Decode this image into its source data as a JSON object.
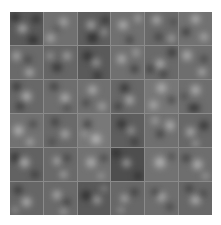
{
  "figure": {
    "rows": 6,
    "cols": 6,
    "separator_color": "#8a8a8a",
    "cells": [
      {
        "base": "#5a5a5a",
        "blobs": [
          [
            "l",
            38,
            50,
            40,
            36
          ],
          [
            "d",
            70,
            85,
            45,
            30
          ],
          [
            "d",
            15,
            15,
            35,
            30
          ],
          [
            "d",
            80,
            20,
            30,
            30
          ]
        ]
      },
      {
        "base": "#707070",
        "blobs": [
          [
            "l",
            60,
            30,
            35,
            30
          ],
          [
            "d",
            40,
            50,
            18,
            18
          ],
          [
            "l",
            20,
            80,
            35,
            30
          ]
        ]
      },
      {
        "base": "#5e5e5e",
        "blobs": [
          [
            "d",
            45,
            78,
            45,
            35
          ],
          [
            "l",
            40,
            40,
            35,
            30
          ],
          [
            "d",
            85,
            25,
            25,
            30
          ],
          [
            "l",
            80,
            60,
            25,
            25
          ]
        ]
      },
      {
        "base": "#707070",
        "blobs": [
          [
            "l",
            35,
            40,
            45,
            30
          ],
          [
            "d",
            55,
            85,
            30,
            25
          ],
          [
            "l",
            80,
            20,
            25,
            25
          ]
        ]
      },
      {
        "base": "#6a6a6a",
        "blobs": [
          [
            "l",
            35,
            25,
            40,
            30
          ],
          [
            "d",
            40,
            75,
            30,
            25
          ],
          [
            "l",
            80,
            80,
            25,
            25
          ],
          [
            "d",
            85,
            30,
            20,
            20
          ]
        ]
      },
      {
        "base": "#727272",
        "blobs": [
          [
            "l",
            50,
            20,
            40,
            30
          ],
          [
            "d",
            20,
            60,
            30,
            30
          ],
          [
            "l",
            75,
            75,
            30,
            30
          ]
        ]
      },
      {
        "base": "#6a6a6a",
        "blobs": [
          [
            "l",
            20,
            30,
            30,
            35
          ],
          [
            "d",
            55,
            40,
            22,
            22
          ],
          [
            "l",
            60,
            80,
            40,
            28
          ]
        ]
      },
      {
        "base": "#666666",
        "blobs": [
          [
            "d",
            40,
            65,
            40,
            30
          ],
          [
            "l",
            70,
            30,
            30,
            30
          ],
          [
            "l",
            20,
            30,
            25,
            25
          ]
        ]
      },
      {
        "base": "#5a5a5a",
        "blobs": [
          [
            "d",
            30,
            30,
            35,
            35
          ],
          [
            "l",
            55,
            50,
            30,
            30
          ],
          [
            "d",
            60,
            90,
            35,
            25
          ]
        ]
      },
      {
        "base": "#707070",
        "blobs": [
          [
            "l",
            30,
            40,
            35,
            35
          ],
          [
            "d",
            70,
            70,
            30,
            30
          ],
          [
            "l",
            75,
            20,
            25,
            25
          ]
        ]
      },
      {
        "base": "#6a6a6a",
        "blobs": [
          [
            "l",
            45,
            55,
            35,
            35
          ],
          [
            "d",
            80,
            20,
            30,
            35
          ],
          [
            "d",
            55,
            85,
            28,
            25
          ],
          [
            "d",
            15,
            70,
            25,
            30
          ]
        ]
      },
      {
        "base": "#6e6e6e",
        "blobs": [
          [
            "l",
            25,
            30,
            30,
            45
          ],
          [
            "l",
            70,
            80,
            30,
            30
          ],
          [
            "d",
            75,
            40,
            25,
            25
          ]
        ]
      },
      {
        "base": "#686868",
        "blobs": [
          [
            "d",
            20,
            20,
            30,
            35
          ],
          [
            "l",
            50,
            50,
            40,
            40
          ],
          [
            "d",
            30,
            80,
            30,
            25
          ]
        ]
      },
      {
        "base": "#6e6e6e",
        "blobs": [
          [
            "d",
            30,
            20,
            30,
            25
          ],
          [
            "l",
            65,
            55,
            35,
            35
          ],
          [
            "d",
            70,
            85,
            25,
            20
          ]
        ]
      },
      {
        "base": "#707070",
        "blobs": [
          [
            "l",
            45,
            30,
            40,
            30
          ],
          [
            "d",
            25,
            70,
            25,
            25
          ],
          [
            "l",
            75,
            80,
            30,
            25
          ]
        ]
      },
      {
        "base": "#686868",
        "blobs": [
          [
            "d",
            40,
            25,
            40,
            30
          ],
          [
            "l",
            55,
            60,
            35,
            35
          ],
          [
            "d",
            20,
            80,
            25,
            25
          ]
        ]
      },
      {
        "base": "#777777",
        "blobs": [
          [
            "l",
            50,
            25,
            40,
            35
          ],
          [
            "l",
            25,
            75,
            35,
            30
          ],
          [
            "d",
            80,
            60,
            25,
            25
          ]
        ]
      },
      {
        "base": "#6e6e6e",
        "blobs": [
          [
            "l",
            50,
            30,
            40,
            35
          ],
          [
            "d",
            45,
            85,
            60,
            25
          ],
          [
            "d",
            15,
            50,
            20,
            20
          ]
        ]
      },
      {
        "base": "#727272",
        "blobs": [
          [
            "l",
            25,
            50,
            40,
            40
          ],
          [
            "d",
            70,
            30,
            25,
            25
          ],
          [
            "l",
            60,
            85,
            30,
            25
          ]
        ]
      },
      {
        "base": "#6a6a6a",
        "blobs": [
          [
            "d",
            35,
            25,
            30,
            25
          ],
          [
            "l",
            65,
            60,
            35,
            30
          ],
          [
            "d",
            25,
            85,
            25,
            20
          ]
        ]
      },
      {
        "base": "#787878",
        "blobs": [
          [
            "l",
            55,
            75,
            50,
            35
          ],
          [
            "d",
            30,
            30,
            30,
            30
          ],
          [
            "l",
            20,
            60,
            20,
            20
          ]
        ]
      },
      {
        "base": "#5e5e5e",
        "blobs": [
          [
            "d",
            30,
            30,
            35,
            35
          ],
          [
            "l",
            60,
            50,
            25,
            30
          ],
          [
            "d",
            70,
            85,
            30,
            25
          ]
        ]
      },
      {
        "base": "#707070",
        "blobs": [
          [
            "l",
            75,
            35,
            30,
            45
          ],
          [
            "d",
            45,
            60,
            25,
            30
          ],
          [
            "l",
            30,
            20,
            25,
            25
          ]
        ]
      },
      {
        "base": "#686868",
        "blobs": [
          [
            "d",
            75,
            35,
            30,
            40
          ],
          [
            "l",
            35,
            55,
            35,
            35
          ],
          [
            "l",
            50,
            90,
            30,
            20
          ]
        ]
      },
      {
        "base": "#626262",
        "blobs": [
          [
            "d",
            15,
            30,
            25,
            45
          ],
          [
            "l",
            45,
            45,
            40,
            40
          ],
          [
            "d",
            75,
            80,
            25,
            25
          ]
        ]
      },
      {
        "base": "#6a6a6a",
        "blobs": [
          [
            "l",
            40,
            40,
            30,
            30
          ],
          [
            "d",
            70,
            30,
            25,
            25
          ],
          [
            "l",
            60,
            80,
            30,
            25
          ]
        ]
      },
      {
        "base": "#727272",
        "blobs": [
          [
            "l",
            40,
            45,
            35,
            40
          ],
          [
            "d",
            80,
            30,
            25,
            25
          ],
          [
            "l",
            70,
            85,
            25,
            20
          ]
        ]
      },
      {
        "base": "#4e4e4e",
        "blobs": [
          [
            "l",
            45,
            45,
            35,
            30
          ],
          [
            "d",
            15,
            15,
            30,
            30
          ],
          [
            "d",
            80,
            85,
            30,
            25
          ]
        ]
      },
      {
        "base": "#727272",
        "blobs": [
          [
            "l",
            45,
            45,
            45,
            45
          ],
          [
            "d",
            80,
            25,
            20,
            20
          ]
        ]
      },
      {
        "base": "#6e6e6e",
        "blobs": [
          [
            "l",
            55,
            50,
            40,
            40
          ],
          [
            "d",
            20,
            30,
            25,
            30
          ],
          [
            "l",
            80,
            85,
            25,
            20
          ]
        ]
      },
      {
        "base": "#666666",
        "blobs": [
          [
            "d",
            25,
            25,
            30,
            30
          ],
          [
            "l",
            50,
            60,
            40,
            35
          ],
          [
            "l",
            15,
            85,
            25,
            20
          ]
        ]
      },
      {
        "base": "#6a6a6a",
        "blobs": [
          [
            "l",
            40,
            40,
            35,
            30
          ],
          [
            "d",
            70,
            60,
            25,
            25
          ],
          [
            "l",
            60,
            90,
            30,
            20
          ]
        ]
      },
      {
        "base": "#5a5a5a",
        "blobs": [
          [
            "d",
            25,
            40,
            35,
            40
          ],
          [
            "l",
            60,
            55,
            30,
            30
          ],
          [
            "l",
            80,
            20,
            20,
            20
          ]
        ]
      },
      {
        "base": "#686868",
        "blobs": [
          [
            "l",
            40,
            50,
            35,
            30
          ],
          [
            "d",
            70,
            30,
            25,
            25
          ],
          [
            "l",
            30,
            85,
            25,
            20
          ]
        ]
      },
      {
        "base": "#6e6e6e",
        "blobs": [
          [
            "l",
            50,
            45,
            35,
            35
          ],
          [
            "d",
            30,
            30,
            25,
            25
          ],
          [
            "d",
            75,
            75,
            25,
            25
          ]
        ]
      },
      {
        "base": "#686868",
        "blobs": [
          [
            "l",
            50,
            55,
            45,
            30
          ],
          [
            "d",
            30,
            20,
            25,
            25
          ],
          [
            "d",
            75,
            35,
            20,
            20
          ]
        ]
      }
    ]
  }
}
